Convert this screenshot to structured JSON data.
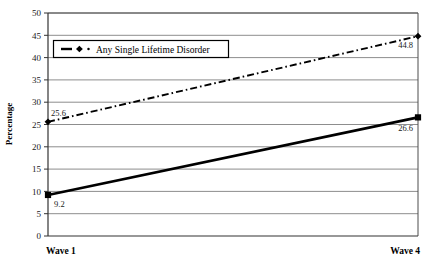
{
  "chart_data": {
    "type": "line",
    "title": "",
    "xlabel": "",
    "ylabel": "Percentage",
    "categories": [
      "Wave 1",
      "Wave 4"
    ],
    "x": [
      0,
      1
    ],
    "xlim": [
      0,
      1
    ],
    "ylim": [
      0,
      50
    ],
    "ytick_step": 5,
    "yticks": [
      "0",
      "5",
      "10",
      "15",
      "20",
      "25",
      "30",
      "35",
      "40",
      "45",
      "50"
    ],
    "grid": "horizontal",
    "legend_position": "top-left-inside",
    "series": [
      {
        "name": "Any Single Lifetime Disorder",
        "style": "dash-dot",
        "marker": "diamond",
        "color": "#000000",
        "in_legend": true,
        "values": [
          25.6,
          44.8
        ],
        "point_labels": [
          "25.6",
          "44.8"
        ]
      },
      {
        "name": "",
        "style": "solid",
        "marker": "square",
        "color": "#000000",
        "in_legend": false,
        "values": [
          9.2,
          26.6
        ],
        "point_labels": [
          "9.2",
          "26.6"
        ]
      }
    ],
    "annotations": [
      {
        "text": "25.6",
        "series": 0,
        "point": 0
      },
      {
        "text": "44.8",
        "series": 0,
        "point": 1
      },
      {
        "text": "9.2",
        "series": 1,
        "point": 0
      },
      {
        "text": "26.6",
        "series": 1,
        "point": 1
      }
    ]
  },
  "legend": {
    "entries": [
      {
        "label": "Any Single Lifetime Disorder"
      }
    ]
  },
  "axes": {
    "y_title": "Percentage",
    "y_ticks": [
      "50",
      "45",
      "40",
      "35",
      "30",
      "25",
      "20",
      "15",
      "10",
      "5",
      "0"
    ],
    "x_labels": [
      "Wave 1",
      "Wave 4"
    ]
  },
  "colors": {
    "line": "#000000",
    "grid": "#808080",
    "axis": "#4d4d4d",
    "text": "#000000",
    "background": "#ffffff"
  }
}
